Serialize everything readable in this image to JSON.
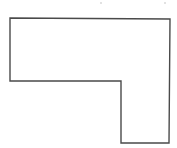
{
  "figure": {
    "type": "l-shaped-polygon",
    "stroke_color": "#4a4a4a",
    "fill_color": "#ffffff",
    "background": "#ffffff",
    "vertices": [
      [
        10,
        18
      ],
      [
        170,
        19
      ],
      [
        169,
        143
      ],
      [
        121,
        143
      ],
      [
        121,
        81
      ],
      [
        10,
        81
      ]
    ]
  }
}
